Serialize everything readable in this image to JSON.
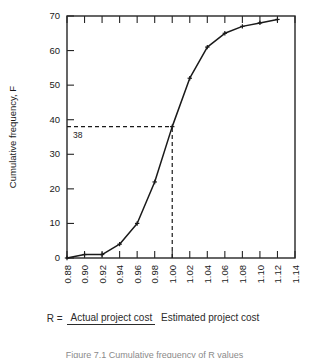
{
  "figure": {
    "caption_lhs": "R =",
    "caption_numerator": "Actual project cost",
    "caption_denominator": "Estimated project cost",
    "figure_caption": "Figure 7.1  Cumulative frequency of R values"
  },
  "chart_data": {
    "type": "line",
    "title": "",
    "xlabel": "R",
    "ylabel": "Cumulative frequency, F",
    "xlim": [
      0.88,
      1.14
    ],
    "ylim": [
      0,
      70
    ],
    "grid": false,
    "legend": "none",
    "x_tick_labels": [
      "0.88",
      "0.90",
      "0.92",
      "0.94",
      "0.96",
      "0.98",
      "1.00",
      "1.02",
      "1.04",
      "1.06",
      "1.08",
      "1.10",
      "1.12",
      "1.14"
    ],
    "x_tick_values": [
      0.88,
      0.9,
      0.92,
      0.94,
      0.96,
      0.98,
      1.0,
      1.02,
      1.04,
      1.06,
      1.08,
      1.1,
      1.12,
      1.14
    ],
    "y_tick_labels": [
      "0",
      "10",
      "20",
      "30",
      "40",
      "50",
      "60",
      "70"
    ],
    "y_tick_values": [
      0,
      10,
      20,
      30,
      40,
      50,
      60,
      70
    ],
    "x": [
      0.88,
      0.9,
      0.92,
      0.94,
      0.96,
      0.98,
      1.0,
      1.02,
      1.04,
      1.06,
      1.08,
      1.1,
      1.12
    ],
    "values": [
      0,
      1,
      1,
      4,
      10,
      22,
      38,
      52,
      61,
      65,
      67,
      68,
      69
    ],
    "annotations": [
      {
        "name": "reference-value",
        "label": "38",
        "x": 1.0,
        "y": 38
      }
    ],
    "reference_lines": [
      {
        "name": "horizontal-reference",
        "orientation": "horizontal",
        "y": 38,
        "style": "dashed",
        "from_x": 0.88,
        "to_x": 1.0
      },
      {
        "name": "vertical-reference",
        "orientation": "vertical",
        "x": 1.0,
        "style": "dashed",
        "from_y": 0,
        "to_y": 38
      }
    ]
  }
}
